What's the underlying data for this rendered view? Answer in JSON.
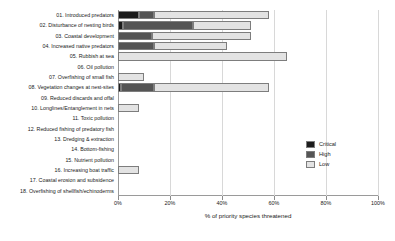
{
  "chart_data": {
    "type": "bar",
    "orientation": "horizontal",
    "stacked": true,
    "title": "",
    "xlabel": "% of priority species threatened",
    "ylabel": "",
    "xlim": [
      0,
      100
    ],
    "xticks": [
      "0%",
      "20%",
      "40%",
      "60%",
      "80%",
      "100%"
    ],
    "xtick_values": [
      0,
      20,
      40,
      60,
      80,
      100
    ],
    "grid": "vertical",
    "legend_position": "right-middle",
    "legend": [
      "Critical",
      "High",
      "Low"
    ],
    "colors": {
      "Critical": "#1c1c1c",
      "High": "#555555",
      "Low": "#e3e3e3"
    },
    "categories": [
      "01. Introduced predators",
      "02. Disturbance of nesting birds",
      "03. Coastal development",
      "04. Increased native predators",
      "05. Rubbish at sea",
      "06. Oil pollution",
      "07. Overfishing of small fish",
      "08. Vegetation changes at nest-sites",
      "09. Reduced discards and offal",
      "10. Longlines/Entanglement in nets",
      "11. Toxic pollution",
      "12. Reduced fishing of predatory fish",
      "13. Dredging & extraction",
      "14. Bottom-fishing",
      "15. Nutrient pollution",
      "16. Increasing boat traffic",
      "17. Coastal erosion and subsidence",
      "18. Overfishing of shellfish/echinoderms"
    ],
    "series": [
      {
        "name": "Critical",
        "values": [
          8,
          2,
          0,
          0,
          0,
          0,
          0,
          1,
          0,
          0,
          0,
          0,
          0,
          0,
          0,
          0,
          0,
          0
        ]
      },
      {
        "name": "High",
        "values": [
          6,
          27,
          13,
          14,
          0,
          0,
          0,
          13,
          0,
          0,
          0,
          0,
          0,
          0,
          0,
          0,
          0,
          0
        ]
      },
      {
        "name": "Low",
        "values": [
          44,
          22,
          38,
          28,
          65,
          0,
          10,
          44,
          0,
          8,
          0,
          0,
          0,
          0,
          0,
          8,
          0,
          0
        ]
      }
    ],
    "totals": [
      58,
      51,
      51,
      42,
      65,
      0,
      10,
      58,
      0,
      8,
      0,
      0,
      0,
      0,
      0,
      8,
      0,
      0
    ]
  }
}
